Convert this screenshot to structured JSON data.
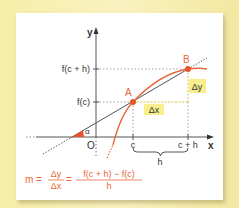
{
  "diagram": {
    "type": "secant-line-slope",
    "axes": {
      "x_label": "x",
      "y_label": "y",
      "origin_label": "O"
    },
    "points": [
      {
        "name": "A",
        "x_label": "c",
        "y_label": "f(c)"
      },
      {
        "name": "B",
        "x_label": "c + h",
        "y_label": "f(c + h)"
      }
    ],
    "angle_label": "α",
    "delta_x_label": "Δx",
    "delta_y_label": "Δy",
    "interval_label": "h",
    "formula": {
      "lhs": "m =",
      "frac1_num": "Δy",
      "frac1_den": "Δx",
      "eq": "=",
      "frac2_num": "f(c + h) − f(c)",
      "frac2_den": "h"
    },
    "colors": {
      "curve": "#e8663a",
      "secant": "#4a5560",
      "highlight": "#f5ea7a",
      "point": "#e8542a",
      "formula": "#e8663a",
      "background": "#f7efb0"
    }
  }
}
